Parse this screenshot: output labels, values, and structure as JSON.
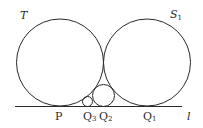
{
  "diagram": {
    "stroke_color": "#2a2a2a",
    "background": "#ffffff",
    "line": {
      "label": "l",
      "x1": 15,
      "y1": 106.5,
      "x2": 182,
      "y2": 106.5
    },
    "circles": [
      {
        "id": "T",
        "label": "T",
        "label_sub": "",
        "cx": 60,
        "cy": 62.5,
        "r": 43.5
      },
      {
        "id": "S1",
        "label": "S",
        "label_sub": "1",
        "cx": 147,
        "cy": 62.5,
        "r": 43.5
      },
      {
        "id": "Q2-circle",
        "cx": 103.5,
        "cy": 95.5,
        "r": 11
      },
      {
        "id": "Q3-circle",
        "cx": 87.5,
        "cy": 101.5,
        "r": 5
      }
    ],
    "labels": {
      "T": {
        "main": "T",
        "sub": ""
      },
      "S1": {
        "main": "S",
        "sub": "1"
      },
      "P": {
        "main": "P",
        "sub": ""
      },
      "Q3": {
        "main": "Q",
        "sub": "3"
      },
      "Q2": {
        "main": "Q",
        "sub": "2"
      },
      "Q1": {
        "main": "Q",
        "sub": "1"
      },
      "l": {
        "main": "l",
        "sub": ""
      }
    }
  }
}
